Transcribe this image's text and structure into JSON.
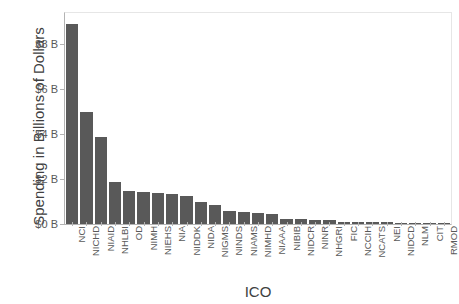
{
  "chart_data": {
    "type": "bar",
    "title": "",
    "xlabel": "ICO",
    "ylabel": "Spending in Billions of Dollars",
    "ylim": [
      0,
      9.4
    ],
    "grid": false,
    "legend": null,
    "y_ticks": [
      {
        "value": 0,
        "label": "$0 B"
      },
      {
        "value": 2,
        "label": "$2 B"
      },
      {
        "value": 4,
        "label": "$4 B"
      },
      {
        "value": 6,
        "label": "$6 B"
      },
      {
        "value": 8,
        "label": "$8 B"
      }
    ],
    "categories": [
      "NCI",
      "NICHD",
      "NIAID",
      "NHLBI",
      "OD",
      "NIMH",
      "NIEHS",
      "NIA",
      "NIDDK",
      "NIDA",
      "NIGMS",
      "NINDS",
      "NIAMS",
      "NIMHD",
      "NIAAA",
      "NIBIB",
      "NIDCR",
      "NINR",
      "NHGRI",
      "FIC",
      "NCCIH",
      "NCATS",
      "NEI",
      "NIDCD",
      "NLM",
      "CIT",
      "RMOD"
    ],
    "values": [
      8.92,
      5.01,
      3.86,
      1.86,
      1.46,
      1.43,
      1.36,
      1.33,
      1.23,
      0.99,
      0.83,
      0.57,
      0.55,
      0.48,
      0.45,
      0.24,
      0.22,
      0.2,
      0.17,
      0.11,
      0.09,
      0.08,
      0.07,
      0.05,
      0.03,
      0.012,
      0.006
    ],
    "bar_color": "#595959",
    "plot_background": "#ffffff",
    "axis_color": "#b3b3b3"
  }
}
